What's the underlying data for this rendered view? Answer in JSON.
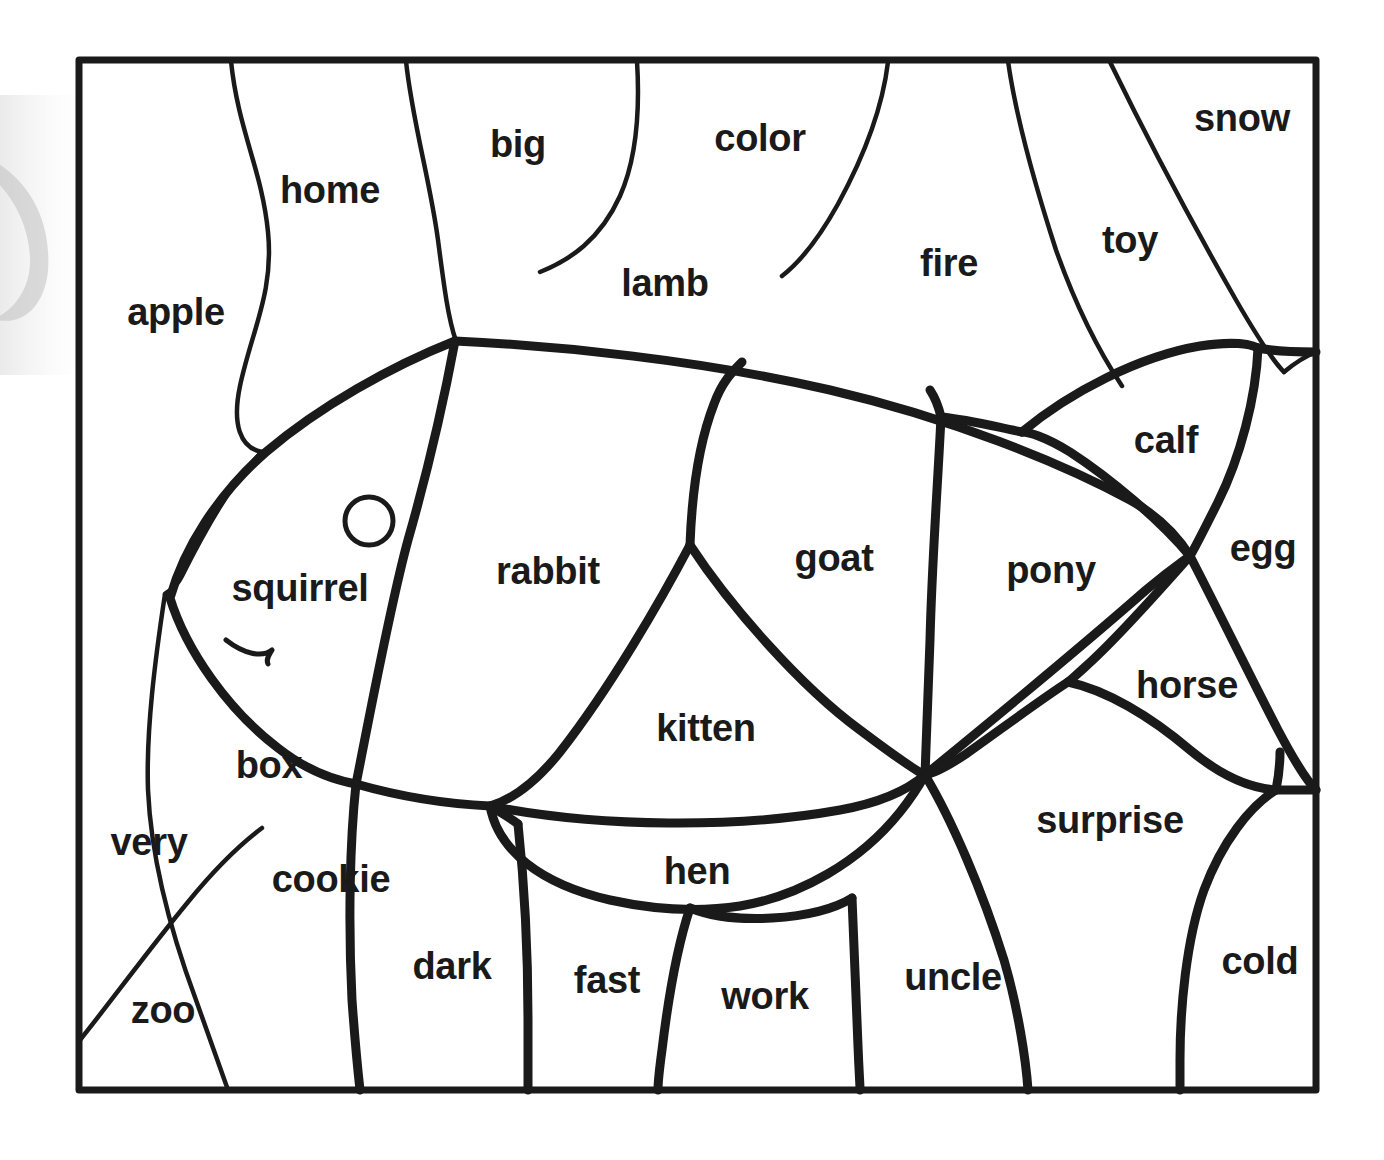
{
  "worksheet": {
    "type": "color-by-word coloring page",
    "picture": "fish",
    "frame": {
      "left": 79,
      "top": 60,
      "right": 1316,
      "bottom": 1090,
      "border_color": "#1a1a1a",
      "border_width": 7
    },
    "ink_color": "#1a1a1a",
    "paper_color": "#ffffff",
    "eye": {
      "cx": 369,
      "cy": 521,
      "r": 24
    }
  },
  "regions": [
    {
      "id": "apple",
      "label": "apple",
      "x": 176,
      "y": 312,
      "size": 38,
      "part": "background-left"
    },
    {
      "id": "home",
      "label": "home",
      "x": 330,
      "y": 190,
      "size": 38,
      "part": "background-top"
    },
    {
      "id": "big",
      "label": "big",
      "x": 518,
      "y": 144,
      "size": 38,
      "part": "background-top"
    },
    {
      "id": "color",
      "label": "color",
      "x": 760,
      "y": 138,
      "size": 38,
      "part": "background-top"
    },
    {
      "id": "snow",
      "label": "snow",
      "x": 1242,
      "y": 118,
      "size": 38,
      "part": "background-top-right"
    },
    {
      "id": "lamb",
      "label": "lamb",
      "x": 665,
      "y": 283,
      "size": 38,
      "part": "background-top"
    },
    {
      "id": "fire",
      "label": "fire",
      "x": 949,
      "y": 263,
      "size": 38,
      "part": "background-top-right"
    },
    {
      "id": "toy",
      "label": "toy",
      "x": 1130,
      "y": 240,
      "size": 38,
      "part": "background-top-right"
    },
    {
      "id": "calf",
      "label": "calf",
      "x": 1166,
      "y": 440,
      "size": 38,
      "part": "tail-upper"
    },
    {
      "id": "egg",
      "label": "egg",
      "x": 1263,
      "y": 548,
      "size": 38,
      "part": "tail-edge"
    },
    {
      "id": "squirrel",
      "label": "squirrel",
      "x": 300,
      "y": 588,
      "size": 38,
      "part": "fish-head"
    },
    {
      "id": "rabbit",
      "label": "rabbit",
      "x": 548,
      "y": 571,
      "size": 38,
      "part": "fish-body"
    },
    {
      "id": "goat",
      "label": "goat",
      "x": 834,
      "y": 558,
      "size": 38,
      "part": "fish-body"
    },
    {
      "id": "pony",
      "label": "pony",
      "x": 1051,
      "y": 570,
      "size": 38,
      "part": "tail-middle"
    },
    {
      "id": "horse",
      "label": "horse",
      "x": 1187,
      "y": 685,
      "size": 38,
      "part": "tail-lower"
    },
    {
      "id": "kitten",
      "label": "kitten",
      "x": 706,
      "y": 728,
      "size": 38,
      "part": "fish-body"
    },
    {
      "id": "box",
      "label": "box",
      "x": 269,
      "y": 765,
      "size": 38,
      "part": "fish-lower-fin"
    },
    {
      "id": "very",
      "label": "very",
      "x": 149,
      "y": 842,
      "size": 38,
      "part": "background-left"
    },
    {
      "id": "cookie",
      "label": "cookie",
      "x": 331,
      "y": 879,
      "size": 38,
      "part": "background-bottom"
    },
    {
      "id": "surprise",
      "label": "surprise",
      "x": 1110,
      "y": 820,
      "size": 38,
      "part": "background-bottom-right"
    },
    {
      "id": "hen",
      "label": "hen",
      "x": 697,
      "y": 871,
      "size": 38,
      "part": "fish-belly"
    },
    {
      "id": "zoo",
      "label": "zoo",
      "x": 163,
      "y": 1010,
      "size": 38,
      "part": "background-bottom-left"
    },
    {
      "id": "dark",
      "label": "dark",
      "x": 452,
      "y": 966,
      "size": 38,
      "part": "background-bottom"
    },
    {
      "id": "fast",
      "label": "fast",
      "x": 607,
      "y": 980,
      "size": 38,
      "part": "background-bottom"
    },
    {
      "id": "work",
      "label": "work",
      "x": 765,
      "y": 996,
      "size": 38,
      "part": "background-bottom"
    },
    {
      "id": "uncle",
      "label": "uncle",
      "x": 953,
      "y": 977,
      "size": 38,
      "part": "background-bottom"
    },
    {
      "id": "cold",
      "label": "cold",
      "x": 1260,
      "y": 961,
      "size": 38,
      "part": "background-bottom-right"
    }
  ]
}
